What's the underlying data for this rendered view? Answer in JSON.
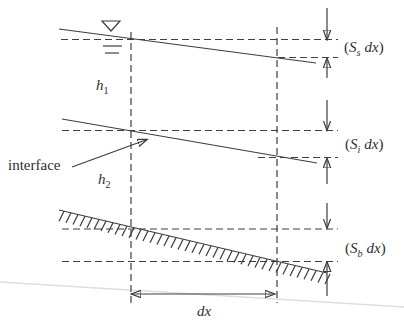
{
  "diagram": {
    "annotations": {
      "interface": "interface",
      "h1": {
        "base": "h",
        "sub": "1"
      },
      "h2": {
        "base": "h",
        "sub": "2"
      },
      "dx": "dx"
    },
    "slope_labels": {
      "surface": {
        "open": "(",
        "symbol": "S",
        "sub": "s",
        "rest": "dx",
        "close": ")"
      },
      "interface": {
        "open": "(",
        "symbol": "S",
        "sub": "i",
        "rest": "dx",
        "close": ")"
      },
      "bed": {
        "open": "(",
        "symbol": "S",
        "sub": "b",
        "rest": "dx",
        "close": ")"
      }
    },
    "symbols": {
      "water_surface_marker": "inverted-triangle"
    },
    "colors": {
      "ink": "#3e3e3e",
      "paper": "#ffffff",
      "scan_artifact": "#dededa"
    }
  }
}
